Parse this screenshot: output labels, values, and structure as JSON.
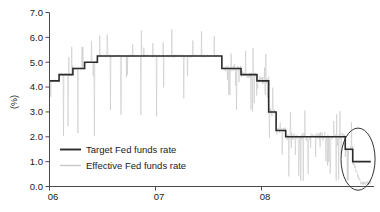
{
  "chart_data": {
    "type": "line",
    "title": "",
    "subtitle": "",
    "xlabel": "",
    "ylabel": "(%)",
    "xlim": [
      2006.0,
      2009.05
    ],
    "ylim": [
      0.0,
      7.0
    ],
    "grid": false,
    "legend_position": "inside-bottom-left",
    "y_ticks": [
      "0.0",
      "1.0",
      "2.0",
      "3.0",
      "4.0",
      "5.0",
      "6.0",
      "7.0"
    ],
    "y_tick_values": [
      0.0,
      1.0,
      2.0,
      3.0,
      4.0,
      5.0,
      6.0,
      7.0
    ],
    "x_ticks": [
      "06",
      "07",
      "08"
    ],
    "x_tick_values": [
      2006.0,
      2007.0,
      2008.0
    ],
    "series": [
      {
        "name": "Target Fed funds rate",
        "color": "#2b2b2b",
        "style": "step",
        "width": 1.6,
        "points": [
          [
            2006.0,
            4.25
          ],
          [
            2006.09,
            4.25
          ],
          [
            2006.09,
            4.5
          ],
          [
            2006.22,
            4.5
          ],
          [
            2006.22,
            4.75
          ],
          [
            2006.33,
            4.75
          ],
          [
            2006.33,
            5.0
          ],
          [
            2006.45,
            5.0
          ],
          [
            2006.45,
            5.25
          ],
          [
            2007.62,
            5.25
          ],
          [
            2007.62,
            4.75
          ],
          [
            2007.8,
            4.75
          ],
          [
            2007.8,
            4.5
          ],
          [
            2007.95,
            4.5
          ],
          [
            2007.95,
            4.25
          ],
          [
            2008.06,
            4.25
          ],
          [
            2008.06,
            3.0
          ],
          [
            2008.13,
            3.0
          ],
          [
            2008.13,
            2.25
          ],
          [
            2008.22,
            2.25
          ],
          [
            2008.22,
            2.0
          ],
          [
            2008.78,
            2.0
          ],
          [
            2008.78,
            1.5
          ],
          [
            2008.85,
            1.5
          ],
          [
            2008.85,
            1.0
          ],
          [
            2009.02,
            1.0
          ]
        ]
      },
      {
        "name": "Effective Fed funds rate",
        "color": "#c8c8c8",
        "style": "noisy-line",
        "width": 0.6,
        "description": "daily effective rate oscillating around the target with frequent downward dips and occasional upward spikes; collapses toward 0.15 at the end of the sample"
      }
    ],
    "annotations": [
      {
        "type": "ellipse",
        "name": "end-of-sample-highlight",
        "cx": 2008.9,
        "cy": 1.1,
        "rx": 0.16,
        "ry": 1.25,
        "color": "#333333"
      }
    ]
  },
  "legend": {
    "items": [
      {
        "label": "Target Fed funds rate",
        "color": "#2b2b2b"
      },
      {
        "label": "Effective Fed funds rate",
        "color": "#c8c8c8"
      }
    ]
  },
  "axes": {
    "y_title": "(%)"
  }
}
